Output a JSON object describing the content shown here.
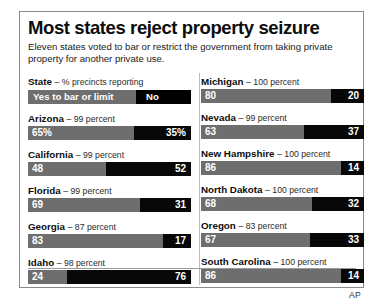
{
  "chart_data": {
    "type": "bar",
    "title": "Most states reject property seizure",
    "subtitle": "Eleven states voted to bar or restrict the government from taking private property for another private use.",
    "xlabel": "",
    "ylabel": "",
    "xlim": [
      0,
      100
    ],
    "grid": false,
    "legend_position": "top-left",
    "orientation": "horizontal-stacked",
    "series": [
      {
        "name": "Yes to bar or limit",
        "color": "#6e6e6e"
      },
      {
        "name": "No",
        "color": "#080808"
      }
    ],
    "categories": [
      "Arizona",
      "California",
      "Florida",
      "Georgia",
      "Idaho",
      "Michigan",
      "Nevada",
      "New Hampshire",
      "North Dakota",
      "Oregon",
      "South Carolina"
    ],
    "values_yes": [
      65,
      48,
      69,
      83,
      24,
      80,
      63,
      86,
      68,
      67,
      86
    ],
    "values_no": [
      35,
      52,
      31,
      17,
      76,
      20,
      37,
      14,
      32,
      33,
      14
    ],
    "precincts_reporting": [
      99,
      99,
      99,
      87,
      98,
      100,
      99,
      100,
      100,
      83,
      100
    ],
    "annotations": [
      "AP"
    ]
  },
  "header": {
    "state_word": "State",
    "state_note": "– % precincts reporting"
  },
  "legend": {
    "yes_label": "Yes to bar or limit",
    "no_label": "No"
  },
  "credit": "AP",
  "left_column": [
    {
      "name": "Arizona",
      "note": "– 99 percent",
      "yes_text": "65%",
      "no_text": "35%",
      "yes_pct": 65
    },
    {
      "name": "California",
      "note": "– 99 percent",
      "yes_text": "48",
      "no_text": "52",
      "yes_pct": 48
    },
    {
      "name": "Florida",
      "note": "– 99 percent",
      "yes_text": "69",
      "no_text": "31",
      "yes_pct": 69
    },
    {
      "name": "Georgia",
      "note": "– 87 percent",
      "yes_text": "83",
      "no_text": "17",
      "yes_pct": 83
    },
    {
      "name": "Idaho",
      "note": "– 98 percent",
      "yes_text": "24",
      "no_text": "76",
      "yes_pct": 24
    }
  ],
  "right_column": [
    {
      "name": "Michigan",
      "note": "– 100 percent",
      "yes_text": "80",
      "no_text": "20",
      "yes_pct": 80
    },
    {
      "name": "Nevada",
      "note": "– 99 percent",
      "yes_text": "63",
      "no_text": "37",
      "yes_pct": 63
    },
    {
      "name": "New Hampshire",
      "note": "– 100 percent",
      "yes_text": "86",
      "no_text": "14",
      "yes_pct": 86
    },
    {
      "name": "North Dakota",
      "note": "– 100 percent",
      "yes_text": "68",
      "no_text": "32",
      "yes_pct": 68
    },
    {
      "name": "Oregon",
      "note": "– 83 percent",
      "yes_text": "67",
      "no_text": "33",
      "yes_pct": 67
    },
    {
      "name": "South Carolina",
      "note": "– 100 percent",
      "yes_text": "86",
      "no_text": "14",
      "yes_pct": 86
    }
  ],
  "colors": {
    "yes_bar": "#6e6e6e",
    "no_bar": "#080808",
    "frame": "#8a8a8a",
    "text": "#111111"
  }
}
